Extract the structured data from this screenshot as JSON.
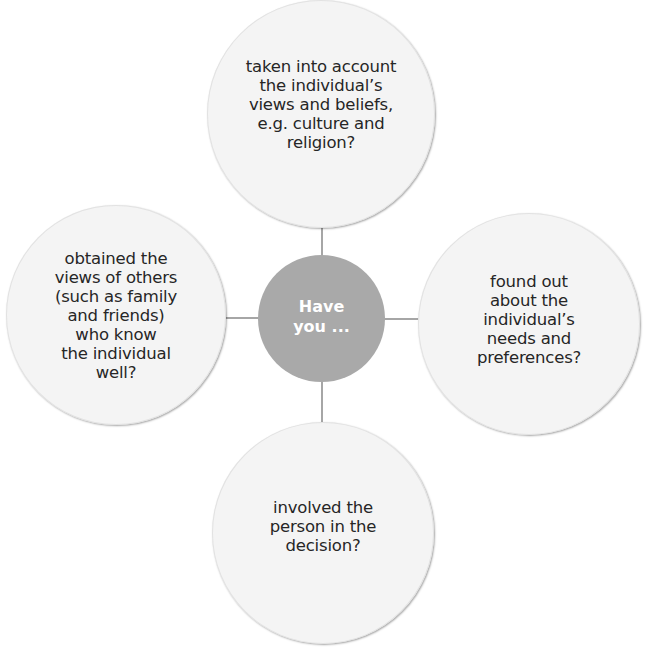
{
  "diagram": {
    "type": "hub-and-spoke",
    "colors": {
      "hub_fill": "#a9a9a9",
      "hub_text": "#ffffff",
      "bubble_fill": "#f4f4f4",
      "bubble_text": "#262626",
      "connector": "#a6a6a6"
    },
    "hub": {
      "label_line1": "Have",
      "label_line2": "you ..."
    },
    "bubbles": [
      {
        "position": "top",
        "lines": [
          "taken into account",
          "the individual’s",
          "views and beliefs,",
          "e.g. culture and",
          "religion?"
        ]
      },
      {
        "position": "right",
        "lines": [
          "found out",
          "about the",
          "individual’s",
          "needs and",
          "preferences?"
        ]
      },
      {
        "position": "bottom",
        "lines": [
          "involved the",
          "person in the",
          "decision?"
        ]
      },
      {
        "position": "left",
        "lines": [
          "obtained the",
          "views of others",
          "(such as family",
          "and friends)",
          "who know",
          "the individual",
          "well?"
        ]
      }
    ]
  }
}
